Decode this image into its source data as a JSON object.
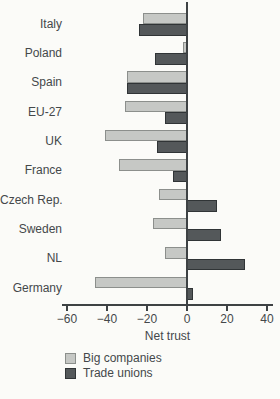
{
  "chart_data": {
    "type": "bar",
    "orientation": "horizontal",
    "title": "",
    "xlabel": "Net trust",
    "ylabel": "",
    "xlim": [
      -60,
      40
    ],
    "xticks": [
      -60,
      -40,
      -20,
      0,
      20,
      40
    ],
    "xtick_labels": [
      "−60",
      "−40",
      "−20",
      "0",
      "20",
      "40"
    ],
    "grid": false,
    "legend_position": "bottom-left",
    "categories": [
      "Italy",
      "Poland",
      "Spain",
      "EU-27",
      "UK",
      "France",
      "Czech Rep.",
      "Sweden",
      "NL",
      "Germany"
    ],
    "series": [
      {
        "name": "Big companies",
        "color": "#c6c8c5",
        "border_color": "#8c8f8c",
        "values": [
          -22,
          -2,
          -30,
          -31,
          -41,
          -34,
          -14,
          -17,
          -11,
          -46
        ]
      },
      {
        "name": "Trade unions",
        "color": "#54585a",
        "border_color": "#303436",
        "values": [
          -24,
          -16,
          -30,
          -11,
          -15,
          -7,
          15,
          17,
          29,
          3
        ]
      }
    ]
  }
}
